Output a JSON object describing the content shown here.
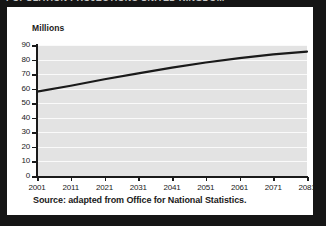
{
  "clipped_header": {
    "text": "POPULATION PROJECTIONS UNITED KINGDOM"
  },
  "figure": {
    "unit_label": "Millions",
    "source_note": "Source: adapted from Office for National Statistics."
  },
  "colors": {
    "page_background": "#151515",
    "card_background": "#ffffff",
    "plot_background": "#e3e3e3",
    "gridline": "#fafafa",
    "axis": "#1a1a1a",
    "series_line": "#1a1a1a",
    "text": "#1a1a1a"
  },
  "chart_data": {
    "type": "line",
    "title": "",
    "subtitle": "",
    "xlabel": "",
    "ylabel": "Millions",
    "categories": [
      "2001",
      "2011",
      "2021",
      "2031",
      "2041",
      "2051",
      "2061",
      "2071",
      "2081"
    ],
    "x": [
      2001,
      2011,
      2021,
      2031,
      2041,
      2051,
      2061,
      2071,
      2081
    ],
    "values": [
      58,
      62,
      66.5,
      70.5,
      74.5,
      78,
      81,
      83.5,
      85.5
    ],
    "series": [
      {
        "name": "UK population projection",
        "values": [
          58,
          62,
          66.5,
          70.5,
          74.5,
          78,
          81,
          83.5,
          85.5
        ]
      }
    ],
    "xlim": [
      2001,
      2081
    ],
    "ylim": [
      0,
      90
    ],
    "ytick_labels": [
      "0",
      "10",
      "20",
      "30",
      "40",
      "50",
      "60",
      "70",
      "80",
      "90"
    ],
    "yticks": [
      0,
      10,
      20,
      30,
      40,
      50,
      60,
      70,
      80,
      90
    ],
    "xtick_labels": [
      "2001",
      "2011",
      "2021",
      "2031",
      "2041",
      "2051",
      "2061",
      "2071",
      "2081"
    ],
    "grid": "horizontal",
    "legend": "none",
    "annotations": []
  }
}
